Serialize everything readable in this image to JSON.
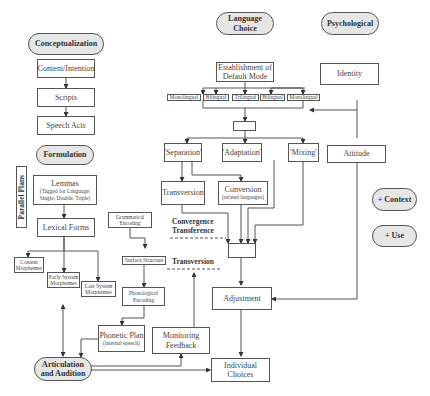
{
  "headers": {
    "conceptualization": "Conceptualization",
    "formulation": "Formulation",
    "language_choice": "Language Choice",
    "psychological": "Psychological",
    "articulation": "Articulation and Audition",
    "context": "+ Context",
    "use": "+ Use"
  },
  "side_label": "Parallel Plans",
  "conceptualization": {
    "content_intention": "Content/Intention",
    "scripts": "Scripts",
    "speech_acts": "Speech Acts"
  },
  "formulation": {
    "lemmas": "Lemmas",
    "lemmas_sub": "(Tagged for Language: Single, Double, Triple)",
    "lexical_forms": "Lexical Forms",
    "content_morphemes": "Content Morphemes",
    "early_system_morphemes": "Early System Morphemes",
    "late_system_morphemes": "Late System Morphemes",
    "grammatical_encoding": "Grammatical Encoding",
    "surface_structure": "Surface Structure",
    "phonological_encoding": "Phonological Encoding",
    "phonetic_plan": "Phonetic Plan",
    "phonetic_plan_sub": "(internal speech)",
    "monitoring_feedback": "Monitoring Feedback"
  },
  "language_choice": {
    "default_mode": "Establishment of Default Mode",
    "modes": [
      "Monolingual",
      "Bilingual",
      "Trilingual",
      "Bilingual",
      "Monolingual"
    ],
    "separation": "'Separation'",
    "adaptation": "'Adaptation'",
    "mixing": "'Mixing'",
    "transversion": "Transversion",
    "conversion": "Conversion",
    "conversion_sub": "(related languages)",
    "adjustment": "Adjustment",
    "individual_choices": "Individual Choices"
  },
  "psychological": {
    "identity": "Identity",
    "attitude": "Attitude"
  },
  "annotations": {
    "convergence_transference": "Convergence Transference",
    "transversion": "Transversion"
  }
}
